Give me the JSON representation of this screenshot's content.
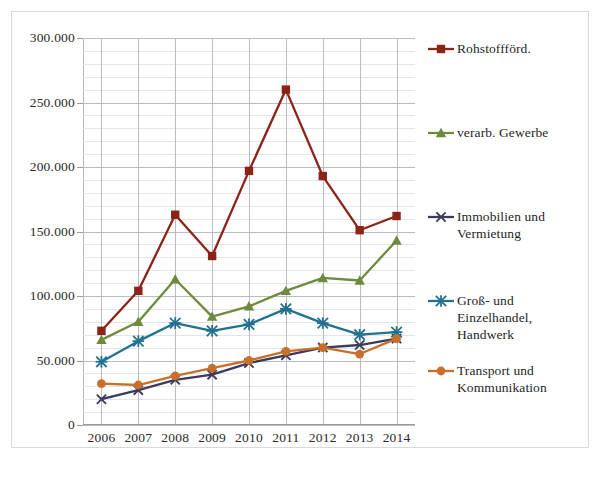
{
  "chart_data": {
    "type": "line",
    "title": "",
    "subtitle": "",
    "xlabel": "",
    "ylabel": "",
    "categories": [
      "2006",
      "2007",
      "2008",
      "2009",
      "2010",
      "2011",
      "2012",
      "2013",
      "2014"
    ],
    "ylim": [
      0,
      300000
    ],
    "y_ticks": [
      0,
      50000,
      100000,
      150000,
      200000,
      250000,
      300000
    ],
    "y_tick_labels": [
      "0",
      "50.000",
      "100.000",
      "150.000",
      "200.000",
      "250.000",
      "300.000"
    ],
    "y_minor_step": 10000,
    "grid": "horizontal-major-minor-and-vertical-major",
    "legend_position": "right",
    "number_format": "de-DE",
    "series": [
      {
        "name": "Rohstoffförd.",
        "color": "#8C2318",
        "marker": "square",
        "values": [
          73000,
          104000,
          163000,
          131000,
          197000,
          260000,
          193000,
          151000,
          162000
        ]
      },
      {
        "name": "verarb. Gewerbe",
        "color": "#6E8B3D",
        "marker": "triangle",
        "values": [
          66000,
          80000,
          113000,
          84000,
          92000,
          104000,
          114000,
          112000,
          143000
        ]
      },
      {
        "name": "Immobilien und\nVermietung",
        "color": "#3B3B5C",
        "marker": "cross",
        "values": [
          20000,
          27000,
          35000,
          39000,
          48000,
          54000,
          60000,
          62000,
          67000
        ]
      },
      {
        "name": "Groß- und\nEinzelhandel,\nHandwerk",
        "color": "#22728F",
        "marker": "asterisk",
        "values": [
          49000,
          65000,
          79000,
          73000,
          78000,
          90000,
          79000,
          70000,
          72000
        ]
      },
      {
        "name": "Transport und\nKommunikation",
        "color": "#C8702A",
        "marker": "circle",
        "values": [
          32000,
          31000,
          38000,
          44000,
          50000,
          57000,
          60000,
          55000,
          67000
        ]
      }
    ]
  }
}
